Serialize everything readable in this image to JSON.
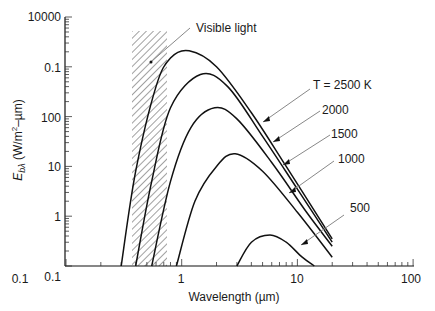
{
  "chart_data": {
    "type": "line",
    "title": "",
    "xlabel": "Wavelength (µm)",
    "ylabel": "E_bλ (W/m²–µm)",
    "xscale": "log",
    "yscale": "log",
    "xlim": [
      0.1,
      100
    ],
    "x_ticks": [
      "0.1",
      "1",
      "10",
      "100"
    ],
    "y_tick_labels_top_to_bottom": [
      "10000",
      "0.1",
      "100",
      "10",
      "1",
      "0.1"
    ],
    "grid": false,
    "legend": "inline arrow annotations",
    "shaded_region": {
      "label": "Visible light",
      "x_range": [
        0.38,
        0.76
      ],
      "pattern": "diagonal hatch"
    },
    "series": [
      {
        "name": "T = 2500 K",
        "label": "T = 2500 K",
        "peak_x": 1.16,
        "end_x": 20,
        "points": [
          [
            0.3,
            0.1
          ],
          [
            0.4,
            8
          ],
          [
            0.6,
            400
          ],
          [
            0.8,
            1500
          ],
          [
            1.16,
            2100
          ],
          [
            2,
            1000
          ],
          [
            4,
            120
          ],
          [
            8,
            10
          ],
          [
            20,
            0.35
          ]
        ]
      },
      {
        "name": "2000",
        "label": "2000",
        "peak_x": 1.45,
        "end_x": 20,
        "points": [
          [
            0.4,
            0.1
          ],
          [
            0.55,
            5
          ],
          [
            0.8,
            150
          ],
          [
            1.45,
            700
          ],
          [
            2.5,
            400
          ],
          [
            5,
            40
          ],
          [
            10,
            3.5
          ],
          [
            20,
            0.3
          ]
        ]
      },
      {
        "name": "1500",
        "label": "1500",
        "peak_x": 1.93,
        "end_x": 20,
        "points": [
          [
            0.55,
            0.1
          ],
          [
            0.8,
            5
          ],
          [
            1.2,
            60
          ],
          [
            1.93,
            150
          ],
          [
            3,
            90
          ],
          [
            6,
            12
          ],
          [
            12,
            1.2
          ],
          [
            20,
            0.25
          ]
        ]
      },
      {
        "name": "1000",
        "label": "1000",
        "peak_x": 2.9,
        "end_x": 20,
        "points": [
          [
            0.9,
            0.1
          ],
          [
            1.3,
            2
          ],
          [
            2,
            10
          ],
          [
            2.9,
            18
          ],
          [
            5,
            8
          ],
          [
            10,
            1.2
          ],
          [
            20,
            0.15
          ]
        ]
      },
      {
        "name": "500",
        "label": "500",
        "peak_x": 5.8,
        "end_x": 14,
        "points": [
          [
            3,
            0.1
          ],
          [
            4,
            0.3
          ],
          [
            5.8,
            0.42
          ],
          [
            8,
            0.3
          ],
          [
            11,
            0.15
          ],
          [
            14,
            0.1
          ]
        ]
      }
    ]
  },
  "axes": {
    "x_label": "Wavelength (µm)",
    "y_label_main": "E",
    "y_label_sub": "bλ",
    "y_label_units": " (W/m",
    "y_label_sup": "2",
    "y_label_tail": "–µm)",
    "x_ticks": [
      "0.1",
      "1",
      "10",
      "100"
    ],
    "y_ticks": [
      "10000",
      "0.1",
      "100",
      "10",
      "1",
      "0.1"
    ]
  },
  "annotations": {
    "visible_light": "Visible light",
    "t2500": "T = 2500 K",
    "t2000": "2000",
    "t1500": "1500",
    "t1000": "1000",
    "t500": "500"
  }
}
